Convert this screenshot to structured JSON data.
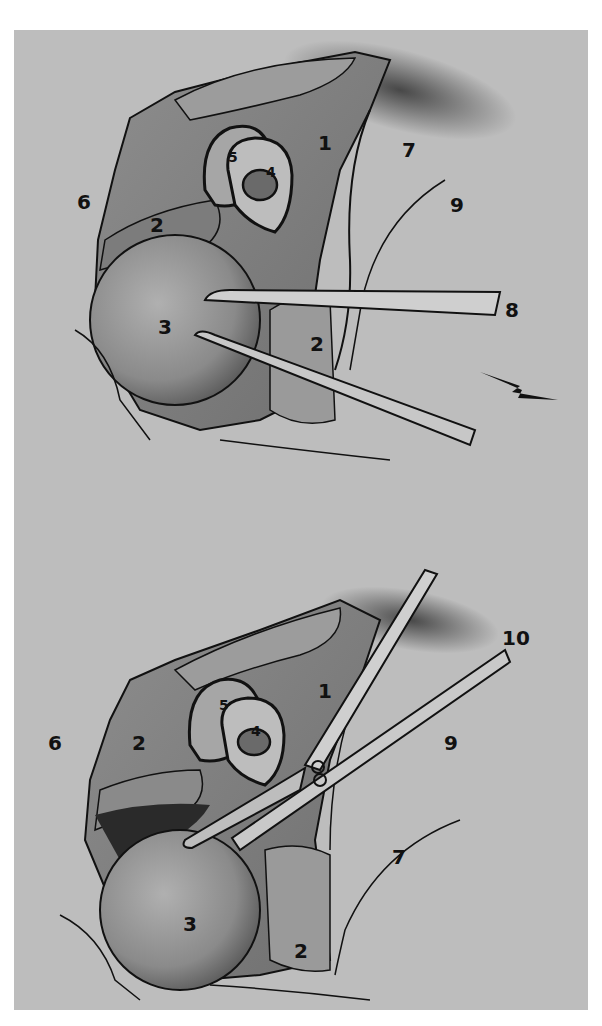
{
  "figure": {
    "background_color": "#bdbdbd",
    "top_panel": {
      "labels": [
        {
          "id": "1",
          "text": "1",
          "x": 318,
          "y": 133
        },
        {
          "id": "2a",
          "text": "2",
          "x": 150,
          "y": 215
        },
        {
          "id": "2b",
          "text": "2",
          "x": 310,
          "y": 334
        },
        {
          "id": "3",
          "text": "3",
          "x": 158,
          "y": 317
        },
        {
          "id": "4",
          "text": "4",
          "x": 266,
          "y": 165,
          "small": true
        },
        {
          "id": "5",
          "text": "5",
          "x": 228,
          "y": 150,
          "small": true
        },
        {
          "id": "6",
          "text": "6",
          "x": 77,
          "y": 192
        },
        {
          "id": "7",
          "text": "7",
          "x": 402,
          "y": 140
        },
        {
          "id": "8",
          "text": "8",
          "x": 505,
          "y": 300
        },
        {
          "id": "9",
          "text": "9",
          "x": 450,
          "y": 195
        }
      ],
      "instrument": "forceps",
      "symbol": "lightning-arrow"
    },
    "bottom_panel": {
      "labels": [
        {
          "id": "1",
          "text": "1",
          "x": 318,
          "y": 681
        },
        {
          "id": "2a",
          "text": "2",
          "x": 132,
          "y": 733
        },
        {
          "id": "2b",
          "text": "2",
          "x": 294,
          "y": 941
        },
        {
          "id": "3",
          "text": "3",
          "x": 183,
          "y": 914
        },
        {
          "id": "4",
          "text": "4",
          "x": 251,
          "y": 724,
          "small": true
        },
        {
          "id": "5",
          "text": "5",
          "x": 219,
          "y": 698,
          "small": true
        },
        {
          "id": "6",
          "text": "6",
          "x": 48,
          "y": 733
        },
        {
          "id": "7",
          "text": "7",
          "x": 392,
          "y": 847
        },
        {
          "id": "9",
          "text": "9",
          "x": 444,
          "y": 733
        },
        {
          "id": "10",
          "text": "10",
          "x": 502,
          "y": 628
        }
      ],
      "instrument": "scissors"
    }
  }
}
